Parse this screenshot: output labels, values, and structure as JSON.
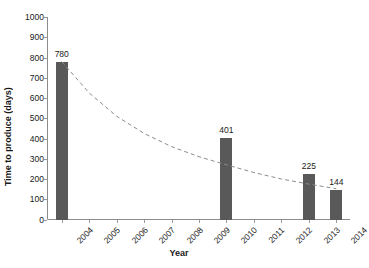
{
  "chart_data": {
    "type": "bar",
    "title": "",
    "xlabel": "Year",
    "ylabel": "Time to produce (days)",
    "categories": [
      "2004",
      "2005",
      "2006",
      "2007",
      "2008",
      "2009",
      "2010",
      "2011",
      "2012",
      "2013",
      "2014"
    ],
    "values": [
      780,
      null,
      null,
      null,
      null,
      null,
      401,
      null,
      null,
      225,
      144
    ],
    "data_labels": [
      "780",
      "",
      "",
      "",
      "",
      "",
      "401",
      "",
      "",
      "225",
      "144"
    ],
    "ylim": [
      0,
      1000
    ],
    "y_ticks": [
      0,
      100,
      200,
      300,
      400,
      500,
      600,
      700,
      800,
      900,
      1000
    ],
    "y_tick_labels": [
      "0",
      "100",
      "200",
      "300",
      "400",
      "500",
      "600",
      "700",
      "800",
      "900",
      "1000"
    ],
    "grid": false,
    "legend": null,
    "bar_color": "#595959",
    "trendline": {
      "style": "dashed",
      "color": "#8c8c8c",
      "type": "exponential",
      "points": [
        [
          2004,
          780
        ],
        [
          2005,
          625
        ],
        [
          2006,
          510
        ],
        [
          2007,
          425
        ],
        [
          2008,
          360
        ],
        [
          2009,
          310
        ],
        [
          2010,
          270
        ],
        [
          2011,
          232
        ],
        [
          2012,
          200
        ],
        [
          2013,
          175
        ],
        [
          2014,
          152
        ]
      ]
    }
  }
}
